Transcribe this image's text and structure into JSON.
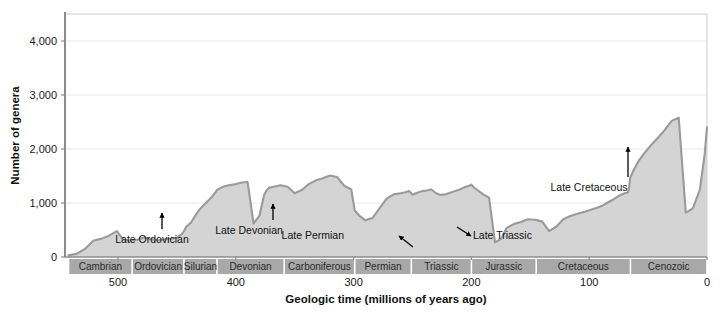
{
  "chart_data": {
    "type": "area",
    "title": "",
    "xlabel": "Geologic time (millions of years ago)",
    "ylabel": "Number of genera",
    "xlim": [
      545,
      0
    ],
    "ylim": [
      0,
      4500
    ],
    "x_reversed": true,
    "grid": true,
    "legend": "none",
    "yticks": [
      0,
      1000,
      2000,
      3000,
      4000
    ],
    "ytick_labels": [
      "0",
      "1,000",
      "2,000",
      "3,000",
      "4,000"
    ],
    "xticks": [
      500,
      400,
      300,
      200,
      100,
      0
    ],
    "xtick_labels": [
      "500",
      "400",
      "300",
      "200",
      "100",
      "0"
    ],
    "series_name": "Number of marine animal genera",
    "x": [
      542,
      535,
      528,
      521,
      514,
      508,
      501,
      496,
      490,
      484,
      478,
      472,
      466,
      460,
      455,
      450,
      446,
      444,
      442,
      438,
      434,
      430,
      425,
      420,
      416,
      411,
      406,
      400,
      395,
      390,
      385,
      380,
      376,
      374,
      372,
      368,
      362,
      356,
      350,
      344,
      338,
      332,
      326,
      320,
      314,
      308,
      302,
      299,
      295,
      290,
      284,
      278,
      272,
      266,
      260,
      256,
      253,
      251,
      250,
      248,
      246,
      242,
      238,
      234,
      230,
      226,
      222,
      218,
      214,
      210,
      206,
      202,
      200,
      198,
      195,
      190,
      185,
      180,
      175,
      170,
      164,
      158,
      152,
      146,
      140,
      134,
      128,
      122,
      116,
      110,
      104,
      98,
      92,
      88,
      85,
      80,
      75,
      70,
      67,
      66,
      65.5,
      65,
      62,
      58,
      54,
      48,
      42,
      36,
      30,
      24,
      18,
      12,
      6,
      2,
      0
    ],
    "y": [
      30,
      60,
      150,
      300,
      340,
      390,
      480,
      330,
      300,
      320,
      360,
      330,
      310,
      330,
      340,
      360,
      420,
      480,
      560,
      640,
      780,
      900,
      1010,
      1120,
      1240,
      1300,
      1330,
      1350,
      1380,
      1390,
      620,
      760,
      1150,
      1230,
      1280,
      1300,
      1330,
      1300,
      1180,
      1240,
      1350,
      1420,
      1460,
      1510,
      1480,
      1320,
      1250,
      860,
      760,
      680,
      720,
      900,
      1080,
      1160,
      1180,
      1200,
      1220,
      1180,
      1150,
      1170,
      1190,
      1220,
      1230,
      1250,
      1180,
      1150,
      1160,
      1190,
      1220,
      1250,
      1290,
      1320,
      1340,
      1290,
      1240,
      1160,
      1100,
      270,
      330,
      540,
      610,
      650,
      700,
      690,
      660,
      480,
      560,
      700,
      760,
      800,
      840,
      880,
      920,
      960,
      1000,
      1060,
      1130,
      1180,
      1200,
      1300,
      1420,
      1480,
      1620,
      1780,
      1900,
      2060,
      2200,
      2350,
      2520,
      2580,
      820,
      900,
      1250,
      1900,
      2400,
      2560,
      2550,
      2640,
      2800,
      2900,
      3050,
      3400,
      3550,
      3700,
      3950,
      4100,
      4250,
      4420
    ],
    "annotations": [
      {
        "label": "Late Ordovician",
        "arrow": "up",
        "x_text": 152,
        "y_text": 243,
        "ax": 162,
        "ay": 213,
        "bx": 162,
        "by": 229
      },
      {
        "label": "Late Devonian",
        "arrow": "up",
        "x_text": 249,
        "y_text": 234,
        "ax": 273,
        "ay": 204,
        "bx": 273,
        "by": 220
      },
      {
        "label": "Late Permian",
        "arrow": "down-right",
        "x_text": 344,
        "y_text": 239,
        "ax": 399,
        "ay": 236,
        "bx": 413,
        "by": 247
      },
      {
        "label": "Late Triassic",
        "arrow": "up-left",
        "x_text": 473,
        "y_text": 239,
        "ax": 471,
        "ay": 236,
        "bx": 457,
        "by": 227
      },
      {
        "label": "Late Cretaceous",
        "arrow": "up",
        "x_text": 589,
        "y_text": 191,
        "ax": 628,
        "ay": 147,
        "bx": 628,
        "by": 177
      }
    ],
    "periods": [
      {
        "name": "Cambrian",
        "start": 542,
        "end": 488
      },
      {
        "name": "Ordovician",
        "start": 488,
        "end": 444
      },
      {
        "name": "Silurian",
        "start": 444,
        "end": 416
      },
      {
        "name": "Devonian",
        "start": 416,
        "end": 359
      },
      {
        "name": "Carboniferous",
        "start": 359,
        "end": 299
      },
      {
        "name": "Permian",
        "start": 299,
        "end": 251
      },
      {
        "name": "Triassic",
        "start": 251,
        "end": 200
      },
      {
        "name": "Jurassic",
        "start": 200,
        "end": 145
      },
      {
        "name": "Cretaceous",
        "start": 145,
        "end": 65
      },
      {
        "name": "Cenozoic",
        "start": 65,
        "end": 0
      }
    ],
    "colors": {
      "area_fill": "#d4d4d4",
      "curve_line": "#9a9a9a",
      "axis": "#8c8c8c",
      "grid": "#e9e9e9",
      "period_band": "#a8a8a8",
      "text": "#1a1a1a"
    }
  }
}
